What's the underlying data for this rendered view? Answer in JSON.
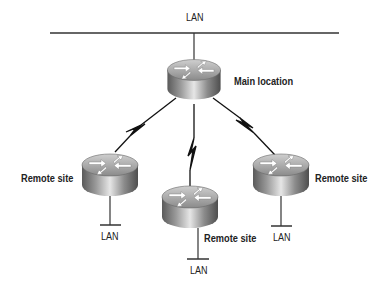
{
  "diagram": {
    "top_lan": {
      "label": "LAN"
    },
    "main_router": {
      "label": "Main location"
    },
    "remote_left": {
      "label": "Remote site",
      "lan_label": "LAN"
    },
    "remote_center": {
      "label": "Remote site",
      "lan_label": "LAN"
    },
    "remote_right": {
      "label": "Remote site",
      "lan_label": "LAN"
    },
    "links": [
      {
        "from": "Main location",
        "to": "Remote site (left)",
        "type": "WAN serial (lightning)"
      },
      {
        "from": "Main location",
        "to": "Remote site (center)",
        "type": "WAN serial (lightning)"
      },
      {
        "from": "Main location",
        "to": "Remote site (right)",
        "type": "WAN serial (lightning)"
      }
    ],
    "colors": {
      "line": "#333333",
      "router_dark": "#6e6e6e",
      "router_light": "#d8d8d8",
      "text": "#222222"
    }
  }
}
